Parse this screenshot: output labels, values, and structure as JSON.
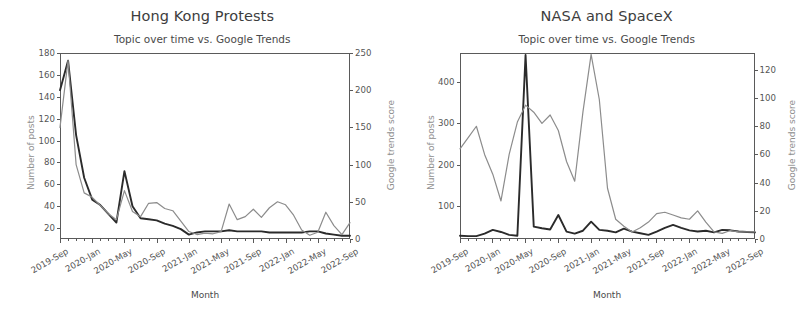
{
  "figure": {
    "width": 809,
    "height": 314,
    "background": "#ffffff",
    "series_colors": {
      "posts": "#2b2b2b",
      "trends": "#8c8c8c"
    }
  },
  "panels": [
    {
      "key": "hong_kong",
      "suptitle": "Hong Kong Protests",
      "axis_title": "Topic over time vs. Google Trends",
      "xlabel": "Month",
      "ylabel_left": "Number of posts",
      "ylabel_right": "Google trends score",
      "yticks_left": [
        "20",
        "40",
        "60",
        "80",
        "100",
        "120",
        "140",
        "160",
        "180"
      ],
      "yticks_right": [
        "0",
        "50",
        "100",
        "150",
        "200",
        "250"
      ],
      "xticks": [
        "2019-Sep",
        "2020-Jan",
        "2020-May",
        "2020-Sep",
        "2021-Jan",
        "2021-May",
        "2021-Sep",
        "2022-Jan",
        "2022-May",
        "2022-Sep"
      ]
    },
    {
      "key": "nasa_spacex",
      "suptitle": "NASA and SpaceX",
      "axis_title": "Topic over time vs. Google Trends",
      "xlabel": "Month",
      "ylabel_left": "Number of posts",
      "ylabel_right": "Google trends score",
      "yticks_left": [
        "100",
        "200",
        "300",
        "400"
      ],
      "yticks_right": [
        "0",
        "20",
        "40",
        "60",
        "80",
        "100",
        "120"
      ],
      "xticks": [
        "2019-Sep",
        "2020-Jan",
        "2020-May",
        "2020-Sep",
        "2021-Jan",
        "2021-May",
        "2021-Sep",
        "2022-Jan",
        "2022-May",
        "2022-Sep"
      ]
    }
  ],
  "chart_data": [
    {
      "type": "line",
      "title": "Hong Kong Protests",
      "subtitle": "Topic over time vs. Google Trends",
      "xlabel": "Month",
      "ylabel": "Number of posts",
      "ylabel_secondary": "Google trends score",
      "grid": false,
      "legend": "none",
      "ylim": [
        10,
        180
      ],
      "ylim_secondary": [
        0,
        250
      ],
      "yticks": [
        20,
        40,
        60,
        80,
        100,
        120,
        140,
        160,
        180
      ],
      "yticks_secondary": [
        0,
        50,
        100,
        150,
        200,
        250
      ],
      "x": [
        "2019-Sep",
        "2019-Oct",
        "2019-Nov",
        "2019-Dec",
        "2020-Jan",
        "2020-Feb",
        "2020-Mar",
        "2020-Apr",
        "2020-May",
        "2020-Jun",
        "2020-Jul",
        "2020-Aug",
        "2020-Sep",
        "2020-Oct",
        "2020-Nov",
        "2020-Dec",
        "2021-Jan",
        "2021-Feb",
        "2021-Mar",
        "2021-Apr",
        "2021-May",
        "2021-Jun",
        "2021-Jul",
        "2021-Aug",
        "2021-Sep",
        "2021-Oct",
        "2021-Nov",
        "2021-Dec",
        "2022-Jan",
        "2022-Feb",
        "2022-Mar",
        "2022-Apr",
        "2022-May",
        "2022-Jun",
        "2022-Jul",
        "2022-Aug",
        "2022-Sep"
      ],
      "xtick_labels": [
        "2019-Sep",
        "2020-Jan",
        "2020-May",
        "2020-Sep",
        "2021-Jan",
        "2021-May",
        "2021-Sep",
        "2022-Jan",
        "2022-May",
        "2022-Sep"
      ],
      "series": [
        {
          "name": "Number of posts",
          "axis": "left",
          "color": "#2b2b2b",
          "values": [
            146,
            173,
            105,
            66,
            46,
            41,
            33,
            25,
            72,
            40,
            29,
            28,
            27,
            24,
            22,
            19,
            14,
            16,
            17,
            17,
            17,
            18,
            17,
            17,
            17,
            17,
            16,
            16,
            16,
            16,
            16,
            17,
            17,
            15,
            14,
            13,
            13
          ]
        },
        {
          "name": "Google trends score",
          "axis": "right",
          "color": "#8c8c8c",
          "values": [
            150,
            240,
            100,
            62,
            56,
            45,
            34,
            26,
            65,
            37,
            30,
            48,
            49,
            41,
            38,
            24,
            10,
            6,
            8,
            7,
            10,
            47,
            26,
            30,
            40,
            29,
            42,
            50,
            46,
            32,
            12,
            5,
            9,
            36,
            18,
            6,
            22
          ]
        }
      ]
    },
    {
      "type": "line",
      "title": "NASA and SpaceX",
      "subtitle": "Topic over time vs. Google Trends",
      "xlabel": "Month",
      "ylabel": "Number of posts",
      "ylabel_secondary": "Google trends score",
      "grid": false,
      "legend": "none",
      "ylim": [
        20,
        470
      ],
      "ylim_secondary": [
        0,
        132
      ],
      "yticks": [
        100,
        200,
        300,
        400
      ],
      "yticks_secondary": [
        0,
        20,
        40,
        60,
        80,
        100,
        120
      ],
      "x": [
        "2019-Sep",
        "2019-Oct",
        "2019-Nov",
        "2019-Dec",
        "2020-Jan",
        "2020-Feb",
        "2020-Mar",
        "2020-Apr",
        "2020-May",
        "2020-Jun",
        "2020-Jul",
        "2020-Aug",
        "2020-Sep",
        "2020-Oct",
        "2020-Nov",
        "2020-Dec",
        "2021-Jan",
        "2021-Feb",
        "2021-Mar",
        "2021-Apr",
        "2021-May",
        "2021-Jun",
        "2021-Jul",
        "2021-Aug",
        "2021-Sep",
        "2021-Oct",
        "2021-Nov",
        "2021-Dec",
        "2022-Jan",
        "2022-Feb",
        "2022-Mar",
        "2022-Apr",
        "2022-May",
        "2022-Jun",
        "2022-Jul",
        "2022-Aug",
        "2022-Sep"
      ],
      "xtick_labels": [
        "2019-Sep",
        "2020-Jan",
        "2020-May",
        "2020-Sep",
        "2021-Jan",
        "2021-May",
        "2021-Sep",
        "2022-Jan",
        "2022-May",
        "2022-Sep"
      ],
      "series": [
        {
          "name": "Number of posts",
          "axis": "left",
          "color": "#2b2b2b",
          "values": [
            28,
            27,
            27,
            33,
            42,
            37,
            30,
            28,
            465,
            50,
            46,
            43,
            78,
            38,
            33,
            40,
            62,
            42,
            40,
            36,
            45,
            38,
            34,
            30,
            38,
            47,
            54,
            47,
            41,
            38,
            40,
            36,
            42,
            41,
            38,
            37,
            36
          ]
        },
        {
          "name": "Google trends score",
          "axis": "right",
          "color": "#8c8c8c",
          "values": [
            64,
            72,
            80,
            60,
            46,
            27,
            60,
            83,
            95,
            90,
            82,
            88,
            77,
            55,
            41,
            90,
            131,
            99,
            36,
            14,
            9,
            5,
            8,
            12,
            18,
            19,
            17,
            15,
            14,
            20,
            12,
            5,
            4,
            6,
            5,
            5,
            5
          ]
        }
      ]
    }
  ]
}
